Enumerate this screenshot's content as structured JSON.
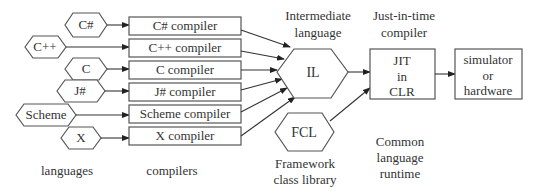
{
  "diagram": {
    "languages": [
      {
        "label": "C#"
      },
      {
        "label": "C++"
      },
      {
        "label": "C"
      },
      {
        "label": "J#"
      },
      {
        "label": "Scheme"
      },
      {
        "label": "X"
      }
    ],
    "compilers": [
      {
        "label": "C# compiler"
      },
      {
        "label": "C++ compiler"
      },
      {
        "label": "C compiler"
      },
      {
        "label": "J# compiler"
      },
      {
        "label": "Scheme compiler"
      },
      {
        "label": "X compiler"
      }
    ],
    "il": {
      "label": "IL",
      "caption_line1": "Intermediate",
      "caption_line2": "language"
    },
    "fcl": {
      "label": "FCL",
      "caption_line1": "Framework",
      "caption_line2": "class library"
    },
    "jit": {
      "line1": "JIT",
      "line2": "in",
      "line3": "CLR",
      "caption_line1": "Just-in-time",
      "caption_line2": "compiler"
    },
    "target": {
      "line1": "simulator",
      "line2": "or",
      "line3": "hardware"
    },
    "clr_caption": {
      "line1": "Common",
      "line2": "language",
      "line3": "runtime"
    },
    "column_labels": {
      "languages": "languages",
      "compilers": "compilers"
    }
  }
}
